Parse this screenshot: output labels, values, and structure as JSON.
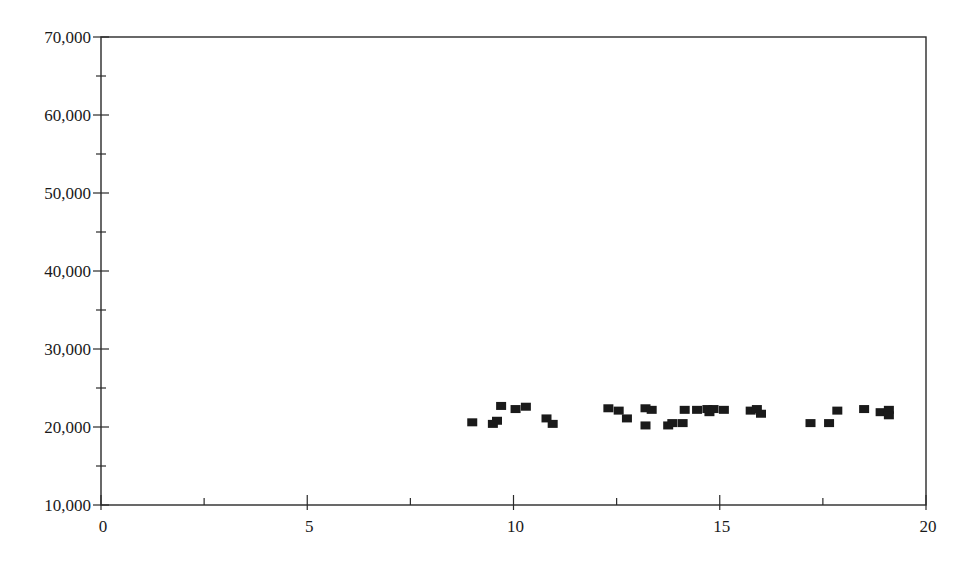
{
  "chart_data": {
    "type": "scatter",
    "title": "",
    "xlabel": "",
    "ylabel": "",
    "xlim": [
      0,
      20
    ],
    "ylim": [
      10000,
      70000
    ],
    "grid": false,
    "legend": null,
    "x_ticks_major": [
      0,
      5,
      10,
      15,
      20
    ],
    "x_tick_labels": [
      "0",
      "5",
      "10",
      "15",
      "20"
    ],
    "x_ticks_minor": [
      2.5,
      7.5,
      12.5,
      17.5
    ],
    "y_ticks_major": [
      10000,
      20000,
      30000,
      40000,
      50000,
      60000,
      70000
    ],
    "y_tick_labels": [
      "10,000",
      "20,000",
      "30,000",
      "40,000",
      "50,000",
      "60,000",
      "70,000"
    ],
    "y_ticks_minor": [
      15000,
      25000,
      35000,
      45000,
      55000,
      65000
    ],
    "marker": "square",
    "marker_color": "#1a1a1a",
    "series": [
      {
        "name": "points",
        "points": [
          [
            9.0,
            20600
          ],
          [
            9.5,
            20400
          ],
          [
            9.6,
            20800
          ],
          [
            9.7,
            22700
          ],
          [
            10.05,
            22300
          ],
          [
            10.3,
            22600
          ],
          [
            10.8,
            21100
          ],
          [
            10.95,
            20400
          ],
          [
            12.3,
            22400
          ],
          [
            12.55,
            22100
          ],
          [
            12.75,
            21100
          ],
          [
            13.2,
            20200
          ],
          [
            13.2,
            22400
          ],
          [
            13.35,
            22200
          ],
          [
            13.75,
            20200
          ],
          [
            13.85,
            20500
          ],
          [
            14.1,
            20500
          ],
          [
            14.15,
            22200
          ],
          [
            14.45,
            22200
          ],
          [
            14.7,
            22300
          ],
          [
            14.75,
            21900
          ],
          [
            14.85,
            22300
          ],
          [
            15.1,
            22200
          ],
          [
            15.75,
            22100
          ],
          [
            15.9,
            22300
          ],
          [
            16.0,
            21700
          ],
          [
            17.2,
            20500
          ],
          [
            17.65,
            20500
          ],
          [
            17.85,
            22100
          ],
          [
            18.5,
            22300
          ],
          [
            18.9,
            21900
          ],
          [
            19.1,
            22200
          ],
          [
            19.1,
            21500
          ]
        ]
      }
    ]
  }
}
